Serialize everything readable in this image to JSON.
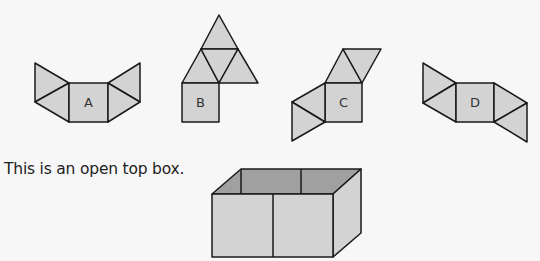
{
  "nets": [
    {
      "label": "A"
    },
    {
      "label": "B"
    },
    {
      "label": "C"
    },
    {
      "label": "D"
    }
  ],
  "caption": "This is an open top box.",
  "colors": {
    "face_fill": "#d3d3d3",
    "inside_fill": "#a0a0a0",
    "stroke": "#1a1a1a"
  }
}
